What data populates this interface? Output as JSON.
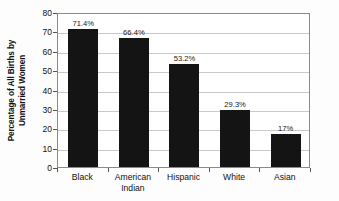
{
  "chart_data": {
    "type": "bar",
    "title": "",
    "subtitle": "",
    "xlabel": "",
    "ylabel": "Percentage of All Births by Unmarried Women",
    "ylabel_lines": [
      "Percentage of All Births by",
      "Unmarried Women"
    ],
    "categories": [
      "Black",
      "American Indian",
      "Hispanic",
      "White",
      "Asian"
    ],
    "category_lines": [
      [
        "Black"
      ],
      [
        "American",
        "Indian"
      ],
      [
        "Hispanic"
      ],
      [
        "White"
      ],
      [
        "Asian"
      ]
    ],
    "values": [
      71.4,
      66.4,
      53.2,
      29.3,
      17
    ],
    "data_labels": [
      "71.4%",
      "66.4%",
      "53.2%",
      "29.3%",
      "17%"
    ],
    "ylim": [
      0,
      80
    ],
    "ytick_step": 10,
    "ytick_labels": [
      "0",
      "10",
      "20",
      "30",
      "40",
      "50",
      "60",
      "70",
      "80"
    ],
    "ytick_values": [
      0,
      10,
      20,
      30,
      40,
      50,
      60,
      70,
      80
    ],
    "grid": true,
    "grid_axis": "y",
    "legend": false,
    "legend_position": "none",
    "bar_color": "#141414",
    "grid_color": "#c9c9c9",
    "axis_color": "#8a8a8a",
    "background_color": "#fdfdfd",
    "plot_background_color": "#ffffff",
    "text_color": "#111111"
  }
}
